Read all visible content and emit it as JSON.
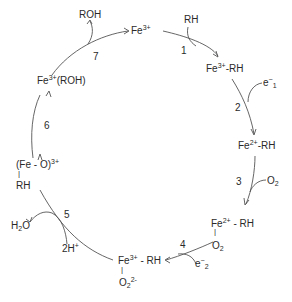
{
  "diagram": {
    "type": "catalytic-cycle",
    "title": "",
    "species": {
      "fe3": {
        "base": "Fe",
        "sup": "3+",
        "suffix": ""
      },
      "fe3_rh": {
        "base": "Fe",
        "sup": "3+",
        "suffix": "-RH"
      },
      "fe2_rh": {
        "base": "Fe",
        "sup": "2+",
        "suffix": "-RH"
      },
      "fe2_rh_o2": {
        "base": "Fe",
        "sup": "2+",
        "suffix": "- RH",
        "below": "O",
        "below_sub": "2"
      },
      "fe3_rh_o2": {
        "base": "Fe",
        "sup": "3+",
        "suffix": "- RH",
        "below": "O",
        "below_sub": "2",
        "below_sup": "2-"
      },
      "feo_rh": {
        "base": "(Fe - O)",
        "sup": "3+",
        "below": "RH"
      },
      "fe3_roh": {
        "base": "Fe",
        "sup": "3+",
        "suffix": "(ROH)"
      }
    },
    "steps": [
      {
        "n": "1",
        "input": "RH"
      },
      {
        "n": "2",
        "input_base": "e",
        "input_sup": "−",
        "input_sub": "1"
      },
      {
        "n": "3",
        "input_base": "O",
        "input_sub": "2"
      },
      {
        "n": "4",
        "input_base": "e",
        "input_sup": "−",
        "input_sub": "2"
      },
      {
        "n": "5",
        "input_base": "2H",
        "input_sup": "+",
        "output_base": "H",
        "output_sub": "2",
        "output_tail": "O"
      },
      {
        "n": "6"
      },
      {
        "n": "7",
        "output": "ROH"
      }
    ],
    "colors": {
      "line": "#555555",
      "text": "#2a2a2a",
      "background": "#ffffff"
    }
  }
}
